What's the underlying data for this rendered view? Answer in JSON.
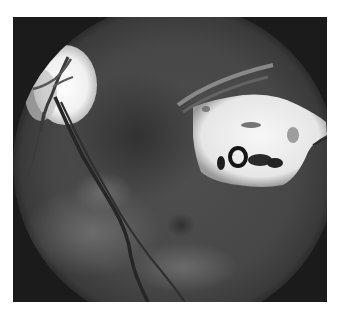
{
  "image": {
    "subject": "retinal fundus photograph",
    "colors": {
      "background": "#ffffff",
      "frame": "#1b1b1b",
      "fundus": "#4a4a4a",
      "optic_disc": "#f2f2f2",
      "lesion": "#eeeeee",
      "vessel": "#2a2a2a"
    }
  }
}
